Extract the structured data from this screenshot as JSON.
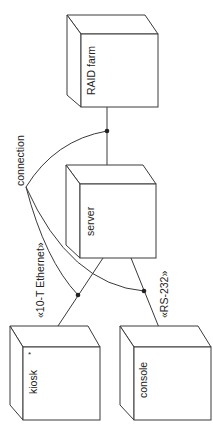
{
  "diagram": {
    "type": "UML deployment diagram (rotated 90°)",
    "nodes": [
      {
        "id": "raid",
        "label": "RAID farm"
      },
      {
        "id": "server",
        "label": "server"
      },
      {
        "id": "kiosk",
        "label": "kiosk",
        "multiplicity": "*"
      },
      {
        "id": "console",
        "label": "console"
      }
    ],
    "links": [
      {
        "from": "server",
        "to": "raid",
        "stereotype": ""
      },
      {
        "from": "server",
        "to": "kiosk",
        "stereotype": "«10-T Ethernet»"
      },
      {
        "from": "server",
        "to": "console",
        "stereotype": "«RS-232»"
      }
    ],
    "note_label": "connection",
    "colors": {
      "line": "#3a3a3a",
      "background": "#ffffff",
      "dot": "#222222"
    }
  }
}
